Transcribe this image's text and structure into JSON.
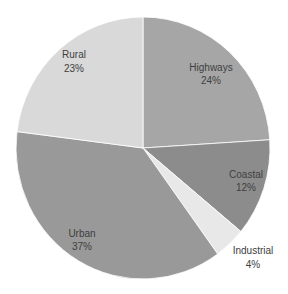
{
  "chart_data": {
    "type": "pie",
    "title": "",
    "categories": [
      "Highways",
      "Coastal",
      "Industrial",
      "Urban",
      "Rural"
    ],
    "values": [
      24,
      12,
      4,
      37,
      23
    ],
    "labels": [
      "24%",
      "12%",
      "4%",
      "37%",
      "23%"
    ],
    "colors": [
      "#a6a6a6",
      "#8c8c8c",
      "#e8e8e8",
      "#999999",
      "#d9d9d9"
    ],
    "start_angle_deg": 0,
    "direction": "clockwise",
    "legend": "none",
    "data_labels": "category and percentage"
  },
  "slices": [
    {
      "name": "Highways",
      "pct": "24%",
      "color": "#a6a6a6",
      "lx": 211,
      "ly": 71
    },
    {
      "name": "Coastal",
      "pct": "12%",
      "color": "#8c8c8c",
      "lx": 246,
      "ly": 178
    },
    {
      "name": "Industrial",
      "pct": "4%",
      "color": "#e8e8e8",
      "lx": 253,
      "ly": 254
    },
    {
      "name": "Urban",
      "pct": "37%",
      "color": "#999999",
      "lx": 82,
      "ly": 237
    },
    {
      "name": "Rural",
      "pct": "23%",
      "color": "#d9d9d9",
      "lx": 74,
      "ly": 58
    }
  ]
}
